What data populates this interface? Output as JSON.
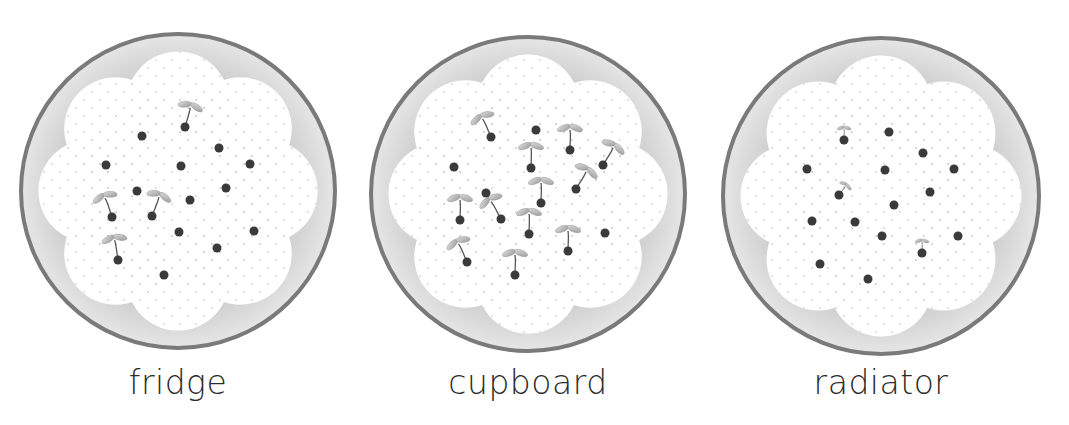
{
  "colors": {
    "rim": "#7a7a7a",
    "dish_fill": "#d9d9d9",
    "cotton": "#ffffff",
    "cotton_dots": "#cfcfcf",
    "seed": "#3a3a3a",
    "leaf": "#b5b5b5",
    "stem": "#555555"
  },
  "dishes": [
    {
      "label": "fridge",
      "cx": 178,
      "cy": 191,
      "r": 157,
      "seeds": [
        {
          "x": 185,
          "y": 127,
          "sprout": true,
          "angle": 15
        },
        {
          "x": 142,
          "y": 136,
          "sprout": false
        },
        {
          "x": 219,
          "y": 148,
          "sprout": false
        },
        {
          "x": 106,
          "y": 165,
          "sprout": false
        },
        {
          "x": 181,
          "y": 166,
          "sprout": false
        },
        {
          "x": 250,
          "y": 164,
          "sprout": false
        },
        {
          "x": 137,
          "y": 191,
          "sprout": false
        },
        {
          "x": 226,
          "y": 188,
          "sprout": false
        },
        {
          "x": 190,
          "y": 200,
          "sprout": false
        },
        {
          "x": 112,
          "y": 217,
          "sprout": true,
          "angle": -20
        },
        {
          "x": 152,
          "y": 216,
          "sprout": true,
          "angle": 20
        },
        {
          "x": 179,
          "y": 232,
          "sprout": false
        },
        {
          "x": 254,
          "y": 231,
          "sprout": false
        },
        {
          "x": 217,
          "y": 248,
          "sprout": false
        },
        {
          "x": 118,
          "y": 260,
          "sprout": true,
          "angle": -10
        },
        {
          "x": 164,
          "y": 275,
          "sprout": false
        }
      ]
    },
    {
      "label": "cupboard",
      "cx": 528,
      "cy": 194,
      "r": 157,
      "seeds": [
        {
          "x": 491,
          "y": 137,
          "sprout": true,
          "angle": -25
        },
        {
          "x": 536,
          "y": 130,
          "sprout": false
        },
        {
          "x": 570,
          "y": 150,
          "sprout": true,
          "angle": 0
        },
        {
          "x": 531,
          "y": 168,
          "sprout": true,
          "angle": 0
        },
        {
          "x": 603,
          "y": 165,
          "sprout": true,
          "angle": 30
        },
        {
          "x": 454,
          "y": 167,
          "sprout": false
        },
        {
          "x": 576,
          "y": 189,
          "sprout": true,
          "angle": 30
        },
        {
          "x": 486,
          "y": 193,
          "sprout": false
        },
        {
          "x": 541,
          "y": 203,
          "sprout": true,
          "angle": 0
        },
        {
          "x": 460,
          "y": 220,
          "sprout": true,
          "angle": 0
        },
        {
          "x": 501,
          "y": 219,
          "sprout": true,
          "angle": -30
        },
        {
          "x": 529,
          "y": 234,
          "sprout": true,
          "angle": 0
        },
        {
          "x": 605,
          "y": 233,
          "sprout": false
        },
        {
          "x": 568,
          "y": 251,
          "sprout": true,
          "angle": 0
        },
        {
          "x": 467,
          "y": 262,
          "sprout": true,
          "angle": -25
        },
        {
          "x": 515,
          "y": 275,
          "sprout": true,
          "angle": 0
        }
      ]
    },
    {
      "label": "radiator",
      "cx": 881,
      "cy": 196,
      "r": 158,
      "seeds": [
        {
          "x": 844,
          "y": 140,
          "sprout": true,
          "angle": 0,
          "small": true
        },
        {
          "x": 889,
          "y": 132,
          "sprout": false
        },
        {
          "x": 923,
          "y": 153,
          "sprout": false
        },
        {
          "x": 807,
          "y": 169,
          "sprout": false
        },
        {
          "x": 885,
          "y": 170,
          "sprout": false
        },
        {
          "x": 954,
          "y": 169,
          "sprout": false
        },
        {
          "x": 930,
          "y": 192,
          "sprout": false
        },
        {
          "x": 839,
          "y": 195,
          "sprout": true,
          "angle": 35,
          "small": true
        },
        {
          "x": 894,
          "y": 205,
          "sprout": false
        },
        {
          "x": 812,
          "y": 221,
          "sprout": false
        },
        {
          "x": 855,
          "y": 222,
          "sprout": false
        },
        {
          "x": 882,
          "y": 236,
          "sprout": false
        },
        {
          "x": 958,
          "y": 236,
          "sprout": false
        },
        {
          "x": 922,
          "y": 253,
          "sprout": true,
          "angle": 0,
          "small": true
        },
        {
          "x": 820,
          "y": 264,
          "sprout": false
        },
        {
          "x": 868,
          "y": 279,
          "sprout": false
        }
      ]
    }
  ]
}
